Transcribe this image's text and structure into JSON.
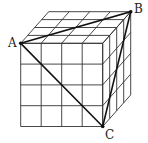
{
  "diagram": {
    "title": "",
    "type": "cube-grid-triangle",
    "grid_divisions": 4,
    "labels": {
      "A": "A",
      "B": "B",
      "C": "C"
    },
    "points": {
      "A": [
        20.7,
        43.3
      ],
      "B": [
        130.7,
        11.7
      ],
      "C": [
        102.7,
        126.5
      ]
    },
    "cube": {
      "front_top_left": [
        20.7,
        43.3
      ],
      "front_top_right": [
        102.7,
        43.3
      ],
      "front_bottom_left": [
        20.7,
        126.5
      ],
      "front_bottom_right": [
        102.7,
        126.5
      ],
      "depth_offset": [
        28,
        -31.6
      ]
    },
    "colors": {
      "line": "#333333",
      "triangle": "#111111",
      "background": "#ffffff"
    }
  }
}
